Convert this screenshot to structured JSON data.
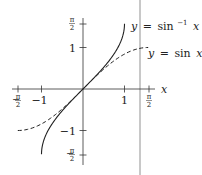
{
  "chart_data": {
    "type": "line",
    "title": "",
    "xlabel": "x",
    "ylabel": "",
    "xlim": [
      -1.72,
      1.75
    ],
    "ylim": [
      -1.85,
      1.72
    ],
    "grid": false,
    "x_ticks": [
      {
        "value": -1.5708,
        "label_num": "π",
        "label_den": "2",
        "sign": "−"
      },
      {
        "value": -1,
        "label": "−1"
      },
      {
        "value": 1,
        "label": "1"
      },
      {
        "value": 1.5708,
        "label_num": "π",
        "label_den": "2",
        "sign": ""
      }
    ],
    "y_ticks": [
      {
        "value": 1.5708,
        "label_num": "π",
        "label_den": "2",
        "sign": ""
      },
      {
        "value": 1,
        "label": "1"
      },
      {
        "value": -1,
        "label": "−1"
      },
      {
        "value": -1.5708,
        "label_num": "π",
        "label_den": "2",
        "sign": "−"
      }
    ],
    "series": [
      {
        "name": "y = sin⁻¹ x",
        "label_text": "y = sin⁻¹ x",
        "style": "solid",
        "function": "asin",
        "domain": [
          -1,
          1
        ],
        "x": [
          -1,
          -0.9,
          -0.7,
          -0.5,
          -0.3,
          0,
          0.3,
          0.5,
          0.7,
          0.9,
          1
        ],
        "values": [
          -1.5708,
          -1.1198,
          -0.7754,
          -0.5236,
          -0.3047,
          0,
          0.3047,
          0.5236,
          0.7754,
          1.1198,
          1.5708
        ]
      },
      {
        "name": "y = sin x",
        "label_text": "y = sin x",
        "style": "dashed",
        "function": "sin",
        "domain": [
          -1.5708,
          1.5708
        ],
        "x": [
          -1.5708,
          -1,
          -0.5,
          0,
          0.5,
          1,
          1.5708
        ],
        "values": [
          -1,
          -0.8415,
          -0.4794,
          0,
          0.4794,
          0.8415,
          1
        ]
      }
    ],
    "annotations": [
      {
        "text_y": "y",
        "text_eq": "=",
        "text_fn": "sin",
        "text_sup": "−1",
        "text_x": "x",
        "target": "y = sin⁻¹ x"
      },
      {
        "text_y": "y",
        "text_eq": "=",
        "text_fn": "sin",
        "text_x": "x",
        "target": "y = sin x"
      }
    ],
    "divider_color": "#c8c8c8",
    "curve_color": "#222222"
  }
}
